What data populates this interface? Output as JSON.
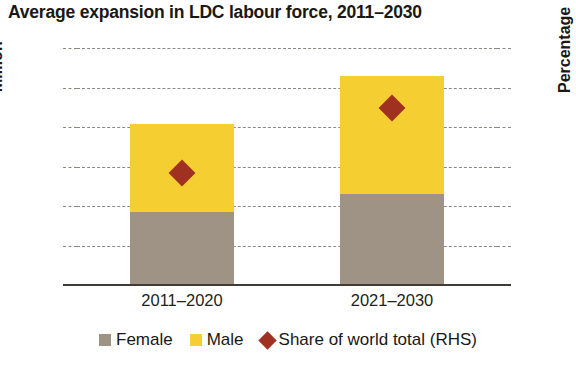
{
  "chart_data": {
    "type": "bar",
    "title": "Average expansion in LDC labour force, 2011–2030",
    "subtitle": "",
    "xlabel": "",
    "ylabel": "Million",
    "ylabel_right": "Percentage",
    "categories": [
      "2011–2020",
      "2021–2030"
    ],
    "stacked": true,
    "grid": true,
    "legend_position": "bottom",
    "ylim": [
      0,
      15
    ],
    "ylim_right": [
      0,
      60
    ],
    "yticks": [
      "0",
      "3",
      "5",
      "8",
      "10",
      "13",
      "15"
    ],
    "ytick_values": [
      0,
      3,
      5,
      8,
      10,
      13,
      15
    ],
    "yticks_right": [
      "0",
      "10",
      "20",
      "30",
      "40",
      "50",
      "60"
    ],
    "ytick_values_right": [
      0,
      10,
      20,
      30,
      40,
      50,
      60
    ],
    "series": [
      {
        "name": "Female",
        "type": "bar",
        "axis": "left",
        "color": "#9e9384",
        "values": [
          4.7,
          5.9
        ]
      },
      {
        "name": "Male",
        "type": "bar",
        "axis": "left",
        "color": "#f5ce32",
        "values": [
          5.5,
          7.7
        ]
      },
      {
        "name": "Share of world total (RHS)",
        "type": "scatter",
        "marker": "diamond",
        "axis": "right",
        "color": "#a03020",
        "values": [
          28.3,
          44.8
        ]
      }
    ],
    "bar_totals": [
      10.2,
      13.6
    ]
  },
  "legend": {
    "items": [
      {
        "label": "Female",
        "color": "#9e9384",
        "marker": "square"
      },
      {
        "label": "Male",
        "color": "#f5ce32",
        "marker": "square"
      },
      {
        "label": "Share of world total (RHS)",
        "color": "#a03020",
        "marker": "diamond"
      }
    ]
  },
  "colors": {
    "female": "#9e9384",
    "male": "#f5ce32",
    "share": "#a03020",
    "axis": "#403b36",
    "grid": "#8d8881",
    "text": "#231f1c"
  }
}
